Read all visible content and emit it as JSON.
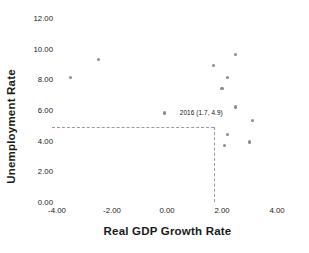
{
  "chart_data": {
    "type": "scatter",
    "title": "",
    "xlabel": "Real GDP Growth Rate",
    "ylabel": "Unemployment Rate",
    "xlim": [
      -4.0,
      4.0
    ],
    "ylim": [
      0.0,
      12.0
    ],
    "xticks": [
      "-4.00",
      "-2.00",
      "0.00",
      "2.00",
      "4.00"
    ],
    "xtick_values": [
      -4.0,
      -2.0,
      0.0,
      2.0,
      4.0
    ],
    "yticks": [
      "0.00",
      "2.00",
      "4.00",
      "6.00",
      "8.00",
      "10.00",
      "12.00"
    ],
    "ytick_values": [
      0.0,
      2.0,
      4.0,
      6.0,
      8.0,
      10.0,
      12.0
    ],
    "grid": false,
    "legend": "none",
    "marker_color": "#8c8c8c",
    "guide_color": "#9a9a9a",
    "points": [
      {
        "x": -3.5,
        "y": 8.1
      },
      {
        "x": -2.5,
        "y": 9.3
      },
      {
        "x": -0.1,
        "y": 5.8
      },
      {
        "x": 1.7,
        "y": 8.9
      },
      {
        "x": 2.0,
        "y": 7.4
      },
      {
        "x": 2.2,
        "y": 8.1
      },
      {
        "x": 2.5,
        "y": 9.6
      },
      {
        "x": 2.5,
        "y": 6.2
      },
      {
        "x": 3.1,
        "y": 5.3
      },
      {
        "x": 2.2,
        "y": 4.4
      },
      {
        "x": 2.1,
        "y": 3.7
      },
      {
        "x": 3.0,
        "y": 3.9
      }
    ],
    "annotations": [
      {
        "text": "2016 (1.7, 4.9)",
        "x": 1.7,
        "y": 4.9,
        "guide_horizontal": true,
        "guide_vertical": true
      }
    ]
  }
}
